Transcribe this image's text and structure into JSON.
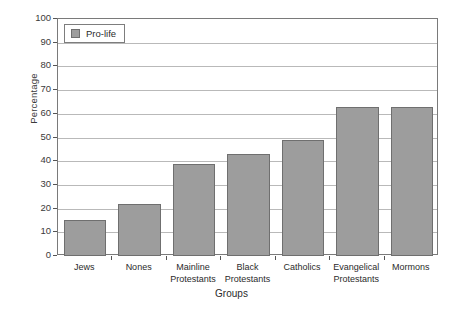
{
  "chart_data": {
    "type": "bar",
    "title": "",
    "xlabel": "Groups",
    "ylabel": "Percentage",
    "ylim": [
      0,
      100
    ],
    "ytick_step": 10,
    "grid": true,
    "legend_position": "top-left",
    "series_name": "Pro-life",
    "bar_color": "#9d9d9d",
    "bar_border_color": "#6f6f6f",
    "categories": [
      "Jews",
      "Nones",
      "Mainline Protestants",
      "Black Protestants",
      "Catholics",
      "Evangelical Protestants",
      "Mormons"
    ],
    "category_lines": [
      [
        "Jews"
      ],
      [
        "Nones"
      ],
      [
        "Mainline",
        "Protestants"
      ],
      [
        "Black",
        "Protestants"
      ],
      [
        "Catholics"
      ],
      [
        "Evangelical",
        "Protestants"
      ],
      [
        "Mormons"
      ]
    ],
    "values": [
      15,
      22,
      39,
      43,
      49,
      63,
      63
    ],
    "yticks": [
      "0",
      "10",
      "20",
      "30",
      "40",
      "50",
      "60",
      "70",
      "80",
      "90",
      "100"
    ]
  },
  "legend": {
    "items": [
      {
        "label": "Pro-life",
        "color": "#9d9d9d"
      }
    ]
  },
  "axes": {
    "y_title": "Percentage",
    "x_title": "Groups"
  }
}
